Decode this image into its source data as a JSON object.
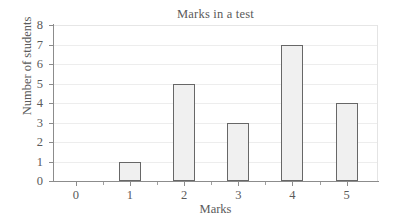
{
  "chart_data": {
    "type": "bar",
    "title": "Marks in a test",
    "xlabel": "Marks",
    "ylabel": "Number of students",
    "categories": [
      "0",
      "1",
      "2",
      "3",
      "4",
      "5"
    ],
    "values": [
      0,
      1,
      5,
      3,
      7,
      4
    ],
    "xlim": [
      -0.42,
      5.58
    ],
    "ylim": [
      0,
      8
    ],
    "ytick_labels": [
      "0",
      "1",
      "2",
      "3",
      "4",
      "5",
      "6",
      "7",
      "8"
    ],
    "ytick_values": [
      0,
      1,
      2,
      3,
      4,
      5,
      6,
      7,
      8
    ],
    "xtick_labels": [
      "0",
      "1",
      "2",
      "3",
      "4",
      "5"
    ],
    "xtick_values": [
      0,
      1,
      2,
      3,
      4,
      5
    ],
    "minor_xticks": [
      0.5,
      1.5,
      2.5,
      3.5,
      4.5
    ],
    "grid": "horizontal",
    "legend": null,
    "bar_fill_color": "#f0f0f0",
    "bar_border_color": "#676767",
    "gridline_color": "#ededed",
    "axis_color": "#8c8c8c",
    "text_color": "#5a5a5a",
    "background_color": "#ffffff"
  }
}
